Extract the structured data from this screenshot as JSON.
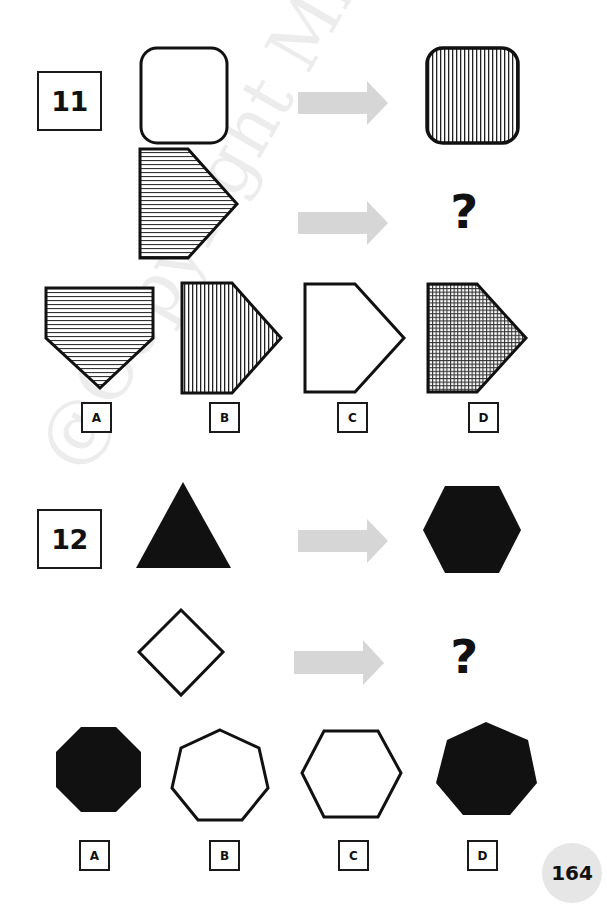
{
  "page": {
    "page_number": "164",
    "watermark": "@Copyright Mr. Mu"
  },
  "colors": {
    "ink": "#111111",
    "arrow": "#d6d6d6",
    "page_badge": "#e6e6e6"
  },
  "questions": [
    {
      "number": "11",
      "rows": [
        {
          "input": "rounded-square-empty",
          "output": "rounded-square-vertical-stripes"
        },
        {
          "input": "pentagon-arrow-horizontal-stripes",
          "output": "?"
        }
      ],
      "unknown_symbol": "?",
      "options": [
        {
          "label": "A",
          "shape": "pentagon-pointing-down-horizontal-stripes"
        },
        {
          "label": "B",
          "shape": "pentagon-arrow-vertical-stripes"
        },
        {
          "label": "C",
          "shape": "pentagon-arrow-empty"
        },
        {
          "label": "D",
          "shape": "pentagon-arrow-crosshatch"
        }
      ]
    },
    {
      "number": "12",
      "rows": [
        {
          "input": "triangle-filled",
          "output": "hexagon-filled"
        },
        {
          "input": "diamond-empty",
          "output": "?"
        }
      ],
      "unknown_symbol": "?",
      "options": [
        {
          "label": "A",
          "shape": "octagon-filled"
        },
        {
          "label": "B",
          "shape": "heptagon-empty"
        },
        {
          "label": "C",
          "shape": "hexagon-empty"
        },
        {
          "label": "D",
          "shape": "heptagon-filled"
        }
      ]
    }
  ]
}
